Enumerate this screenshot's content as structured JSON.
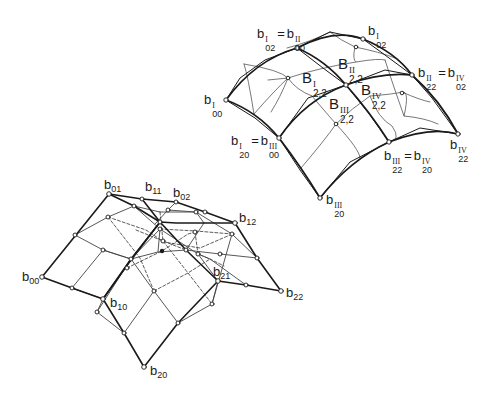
{
  "figure": {
    "colors": {
      "line": "#1a1a1a",
      "thin_line": "#555555",
      "background": "#ffffff"
    }
  },
  "lower_net": {
    "labels": [
      {
        "id": "b00",
        "base": "b",
        "index": "00"
      },
      {
        "id": "b01",
        "base": "b",
        "index": "01"
      },
      {
        "id": "b11",
        "base": "b",
        "index": "11"
      },
      {
        "id": "b02",
        "base": "b",
        "index": "02"
      },
      {
        "id": "b12",
        "base": "b",
        "index": "12"
      },
      {
        "id": "b21",
        "base": "b",
        "index": "21"
      },
      {
        "id": "b22",
        "base": "b",
        "index": "22"
      },
      {
        "id": "b10",
        "base": "b",
        "index": "10"
      },
      {
        "id": "b20",
        "base": "b",
        "index": "20"
      }
    ]
  },
  "upper_patch": {
    "vertex_labels": [
      {
        "id": "b00-I",
        "base": "b",
        "sup": "I",
        "index": "00"
      },
      {
        "id": "b02-I-eq-b00-II",
        "a_sup": "I",
        "a_idx": "02",
        "eq": "=",
        "b_sup": "II",
        "b_idx": "00"
      },
      {
        "id": "b02-I",
        "base": "b",
        "sup": "I",
        "index": "02"
      },
      {
        "id": "b22-II-eq-b02-IV",
        "a_sup": "II",
        "a_idx": "22",
        "eq": "=",
        "b_sup": "IV",
        "b_idx": "02"
      },
      {
        "id": "b22-IV",
        "base": "b",
        "sup": "IV",
        "index": "22"
      },
      {
        "id": "b22-III-eq-b20-IV",
        "a_sup": "III",
        "a_idx": "22",
        "eq": "=",
        "b_sup": "IV",
        "b_idx": "20"
      },
      {
        "id": "b20-III",
        "base": "b",
        "sup": "III",
        "index": "20"
      },
      {
        "id": "b20-I-eq-b00-III",
        "a_sup": "I",
        "a_idx": "20",
        "eq": "=",
        "b_sup": "III",
        "b_idx": "00"
      }
    ],
    "patch_labels": [
      {
        "id": "B22-I",
        "base": "B",
        "sup": "I",
        "index": "2,2"
      },
      {
        "id": "B22-II",
        "base": "B",
        "sup": "II",
        "index": "2,2"
      },
      {
        "id": "B22-III",
        "base": "B",
        "sup": "III",
        "index": "2,2"
      },
      {
        "id": "B22-IV",
        "base": "B",
        "sup": "IV",
        "index": "2,2"
      }
    ]
  }
}
